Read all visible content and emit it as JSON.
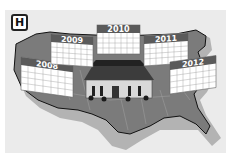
{
  "badge": {
    "letter": "H"
  },
  "illustration": {
    "subject": "United States map with White House and election-cycle calendars",
    "calendars": [
      {
        "year": "2008"
      },
      {
        "year": "2009"
      },
      {
        "year": "2010"
      },
      {
        "year": "2011"
      },
      {
        "year": "2012"
      }
    ]
  },
  "colors": {
    "panel": "#ebebeb",
    "map": "#7a7a7a",
    "map_shadow": "#b0b0b0",
    "outline": "#111111",
    "calendar_header": "#5a5a5a",
    "calendar_grid": "#9a9a9a"
  }
}
